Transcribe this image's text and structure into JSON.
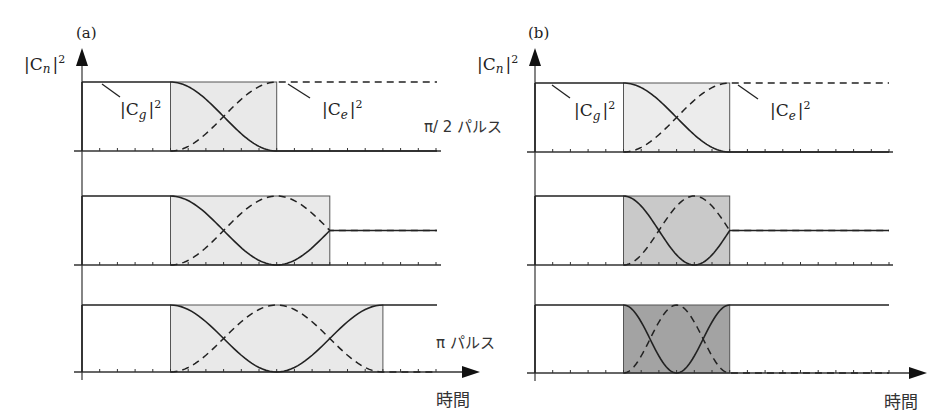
{
  "chart_data": {
    "type": "line",
    "ylabel": "|C_n|^2",
    "xlabel": "時間",
    "ylim": [
      0,
      1
    ],
    "grid": false,
    "legend": {
      "solid": "|C_g|^2",
      "dashed": "|C_e|^2"
    },
    "panels": [
      {
        "label": "(a)",
        "description": "Same field strength, different pulse durations",
        "rows": [
          {
            "pulse_label": "π/2 パルス",
            "pulse_start": 5,
            "pulse_end": 11,
            "rabi_angle_deg": 90,
            "box_shade": "#e9e9e9",
            "final": {
              "Cg2": 0.0,
              "Ce2": 1.0
            }
          },
          {
            "pulse_label": "",
            "pulse_start": 5,
            "pulse_end": 14,
            "rabi_angle_deg": 135,
            "box_shade": "#e9e9e9",
            "final": {
              "Cg2": 0.5,
              "Ce2": 0.5
            }
          },
          {
            "pulse_label": "π パルス",
            "pulse_start": 5,
            "pulse_end": 17,
            "rabi_angle_deg": 180,
            "box_shade": "#e9e9e9",
            "final": {
              "Cg2": 1.0,
              "Ce2": 0.0
            }
          }
        ]
      },
      {
        "label": "(b)",
        "description": "Same pulse duration, increasing field strength",
        "rows": [
          {
            "pulse_label": "",
            "pulse_start": 5,
            "pulse_end": 11,
            "rabi_angle_deg": 90,
            "box_shade": "#ececec",
            "final": {
              "Cg2": 0.0,
              "Ce2": 1.0
            }
          },
          {
            "pulse_label": "",
            "pulse_start": 5,
            "pulse_end": 11,
            "rabi_angle_deg": 135,
            "box_shade": "#c9c9c9",
            "final": {
              "Cg2": 0.5,
              "Ce2": 0.5
            }
          },
          {
            "pulse_label": "",
            "pulse_start": 5,
            "pulse_end": 11,
            "rabi_angle_deg": 180,
            "box_shade": "#a3a3a3",
            "final": {
              "Cg2": 1.0,
              "Ce2": 0.0
            }
          }
        ]
      }
    ],
    "x_ticks_count": 20
  },
  "labels": {
    "panel_a": "(a)",
    "panel_b": "(b)",
    "y_axis": "|C",
    "y_axis_sub": "n",
    "cg": "|C",
    "cg_sub": "g",
    "ce": "|C",
    "ce_sub": "e",
    "sq": "2",
    "bar": "|",
    "half_pulse": "π/ 2 パルス",
    "pi_pulse": "π  パルス",
    "time": "時間"
  }
}
